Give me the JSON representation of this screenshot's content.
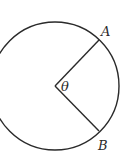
{
  "diagram": {
    "type": "circle-sector",
    "circle": {
      "cx": 55,
      "cy": 86,
      "r": 65,
      "stroke": "#2a2a2a"
    },
    "center": {
      "x": 55,
      "y": 86
    },
    "points": [
      {
        "id": "A",
        "label": "A",
        "x": 99,
        "y": 40
      },
      {
        "id": "B",
        "label": "B",
        "x": 99,
        "y": 131
      }
    ],
    "angle_label": "θ"
  }
}
